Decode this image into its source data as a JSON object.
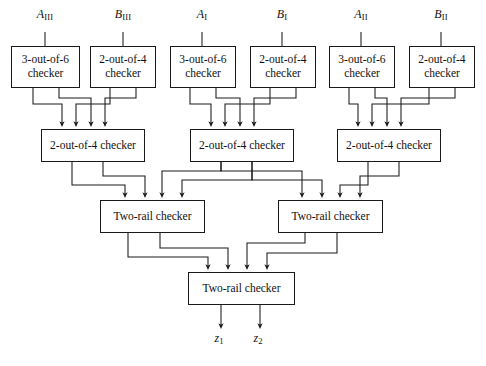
{
  "figure": {
    "type": "block-diagram",
    "width": 486,
    "height": 366,
    "background": "#ffffff",
    "line_color": "#1a1a1a",
    "text_color": "#111111"
  },
  "inputs": [
    {
      "id": "in-a3",
      "base": "A",
      "sub": "III",
      "x": 45,
      "y": 18
    },
    {
      "id": "in-b3",
      "base": "B",
      "sub": "III",
      "x": 123,
      "y": 18
    },
    {
      "id": "in-a1",
      "base": "A",
      "sub": "I",
      "x": 202,
      "y": 18
    },
    {
      "id": "in-b1",
      "base": "B",
      "sub": "I",
      "x": 282,
      "y": 18
    },
    {
      "id": "in-a2",
      "base": "A",
      "sub": "II",
      "x": 361,
      "y": 18
    },
    {
      "id": "in-b2",
      "base": "B",
      "sub": "II",
      "x": 441,
      "y": 18
    }
  ],
  "row1": {
    "checkers": [
      {
        "id": "r1c1",
        "line1": "3-out-of-6",
        "line2": "checker",
        "x": 11,
        "y": 46,
        "w": 69,
        "h": 42
      },
      {
        "id": "r1c2",
        "line1": "2-out-of-4",
        "line2": "checker",
        "x": 90,
        "y": 46,
        "w": 66,
        "h": 42
      },
      {
        "id": "r1c3",
        "line1": "3-out-of-6",
        "line2": "checker",
        "x": 170,
        "y": 46,
        "w": 66,
        "h": 42
      },
      {
        "id": "r1c4",
        "line1": "2-out-of-4",
        "line2": "checker",
        "x": 250,
        "y": 46,
        "w": 66,
        "h": 42
      },
      {
        "id": "r1c5",
        "line1": "3-out-of-6",
        "line2": "checker",
        "x": 329,
        "y": 46,
        "w": 66,
        "h": 42
      },
      {
        "id": "r1c6",
        "line1": "2-out-of-4",
        "line2": "checker",
        "x": 409,
        "y": 46,
        "w": 66,
        "h": 42
      }
    ]
  },
  "row2": {
    "checkers": [
      {
        "id": "r2c1",
        "label": "2-out-of-4 checker",
        "x": 41,
        "y": 129,
        "w": 104,
        "h": 33
      },
      {
        "id": "r2c2",
        "label": "2-out-of-4 checker",
        "x": 190,
        "y": 129,
        "w": 104,
        "h": 33
      },
      {
        "id": "r2c3",
        "label": "2-out-of-4 checker",
        "x": 337,
        "y": 129,
        "w": 104,
        "h": 33
      }
    ]
  },
  "row3": {
    "checkers": [
      {
        "id": "r3c1",
        "label": "Two-rail checker",
        "x": 100,
        "y": 200,
        "w": 105,
        "h": 33
      },
      {
        "id": "r3c2",
        "label": "Two-rail checker",
        "x": 278,
        "y": 200,
        "w": 105,
        "h": 33
      }
    ]
  },
  "row4": {
    "checker": {
      "id": "r4c1",
      "label": "Two-rail checker",
      "x": 188,
      "y": 272,
      "w": 107,
      "h": 33
    }
  },
  "outputs": [
    {
      "id": "out-z1",
      "base": "z",
      "sub": "1",
      "x": 218,
      "y": 338
    },
    {
      "id": "out-z2",
      "base": "z",
      "sub": "2",
      "x": 257,
      "y": 338
    }
  ]
}
